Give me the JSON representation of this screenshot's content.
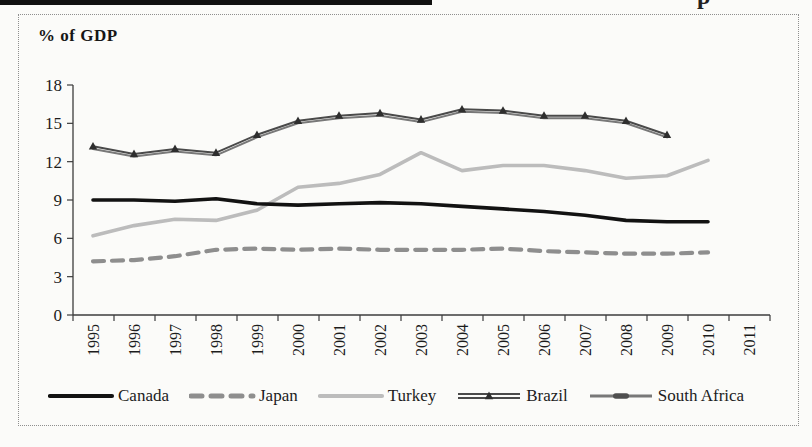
{
  "page": {
    "fragment_top_right": "p"
  },
  "chart": {
    "border_color": "#8f8f8f",
    "axis_color": "#3c3c3c",
    "text_color": "#1c1c1c",
    "marker_color": "#2e2e2e"
  },
  "chart_data": {
    "type": "line",
    "title": "% of GDP",
    "xlabel": "",
    "ylabel": "% of GDP",
    "x": [
      "1995",
      "1996",
      "1997",
      "1998",
      "1999",
      "2000",
      "2001",
      "2002",
      "2003",
      "2004",
      "2005",
      "2006",
      "2007",
      "2008",
      "2009",
      "2010",
      "2011"
    ],
    "ylim": [
      0,
      18
    ],
    "yticks": [
      0,
      3,
      6,
      9,
      12,
      15,
      18
    ],
    "grid": false,
    "legend_position": "bottom",
    "series": [
      {
        "name": "Canada",
        "color": "#121212",
        "style": "solid-thick",
        "values": [
          9.0,
          9.0,
          8.9,
          9.1,
          8.7,
          8.6,
          8.7,
          8.8,
          8.7,
          8.5,
          8.3,
          8.1,
          7.8,
          7.4,
          7.3,
          7.3,
          null
        ]
      },
      {
        "name": "Japan",
        "color": "#8e8e8e",
        "style": "dashed-thick",
        "values": [
          4.2,
          4.3,
          4.6,
          5.1,
          5.2,
          5.1,
          5.2,
          5.1,
          5.1,
          5.1,
          5.2,
          5.0,
          4.9,
          4.8,
          4.8,
          4.9,
          null
        ]
      },
      {
        "name": "Turkey",
        "color": "#bcbcbc",
        "style": "solid-thick",
        "values": [
          6.2,
          7.0,
          7.5,
          7.4,
          8.2,
          10.0,
          10.3,
          11.0,
          12.7,
          11.3,
          11.7,
          11.7,
          11.3,
          10.7,
          10.9,
          12.1,
          null
        ]
      },
      {
        "name": "Brazil",
        "color": "#4a4a4a",
        "style": "thin-line-triangle-markers",
        "values": [
          13.2,
          12.6,
          13.0,
          12.7,
          14.1,
          15.2,
          15.6,
          15.8,
          15.3,
          16.1,
          16.0,
          15.6,
          15.6,
          15.2,
          14.1,
          null,
          null
        ]
      },
      {
        "name": "South Africa",
        "color": "#787878",
        "style": "thin-line-dash-marker",
        "values": [
          13.0,
          12.4,
          12.8,
          12.5,
          13.9,
          15.0,
          15.4,
          15.6,
          15.1,
          15.9,
          15.8,
          15.4,
          15.4,
          15.0,
          13.9,
          null,
          null
        ]
      }
    ]
  }
}
